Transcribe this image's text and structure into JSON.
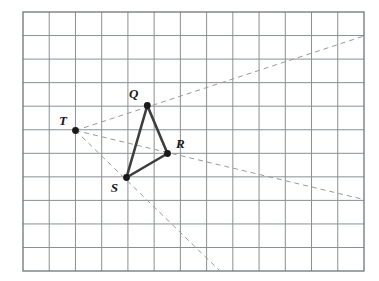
{
  "figure": {
    "name": "dilation-grid-diagram",
    "background_color": "#ffffff"
  },
  "grid": {
    "name": "graph-paper-grid",
    "columns": 13,
    "rows": 11,
    "left": 23,
    "top": 12,
    "right": 364,
    "bottom": 271,
    "cell_width": 26.23,
    "cell_height": 23.55,
    "line_color": "#8a8f96",
    "border_color": "#6f747b",
    "line_width": 1
  },
  "style": {
    "triangle_stroke": "#3d3d3d",
    "triangle_width": 2.6,
    "dashed_stroke": "#9a9a9a",
    "dashed_width": 1,
    "dash_pattern": "5,4",
    "point_fill": "#1a1a1a",
    "point_radius": 3.4,
    "label_color": "#161616"
  },
  "points": [
    {
      "id": "Q",
      "label": "Q",
      "x": 147.3,
      "y": 105.5,
      "label_x": 138.5,
      "label_y": 98,
      "label_anchor": "end"
    },
    {
      "id": "R",
      "label": "R",
      "x": 167.5,
      "y": 153.5,
      "label_x": 176,
      "label_y": 148,
      "label_anchor": "start"
    },
    {
      "id": "S",
      "label": "S",
      "x": 126.5,
      "y": 177.5,
      "label_x": 118,
      "label_y": 192,
      "label_anchor": "end"
    },
    {
      "id": "T",
      "label": "T",
      "x": 75.5,
      "y": 130.5,
      "label_x": 67,
      "label_y": 125,
      "label_anchor": "end"
    }
  ],
  "triangle": {
    "name": "triangle-QRS",
    "vertices": [
      "Q",
      "R",
      "S"
    ],
    "path": "147.3,105.5 167.5,153.5 126.5,177.5"
  },
  "rays": [
    {
      "id": "ray-T-Q",
      "from": "T",
      "through": "Q",
      "x1": 75.5,
      "y1": 130.5,
      "x2": 364,
      "y2": 36
    },
    {
      "id": "ray-T-R",
      "from": "T",
      "through": "R",
      "x1": 75.5,
      "y1": 130.5,
      "x2": 364,
      "y2": 199.5
    },
    {
      "id": "ray-T-S",
      "from": "T",
      "through": "S",
      "x1": 75.5,
      "y1": 130.5,
      "x2": 220,
      "y2": 271
    }
  ],
  "chart_data": {
    "type": "scatter",
    "title": "",
    "xlabel": "",
    "ylabel": "",
    "grid": true,
    "legend": null,
    "annotations": [
      "Q",
      "R",
      "S",
      "T"
    ],
    "points": [
      {
        "label": "Q",
        "px": 147.3,
        "py": 105.5
      },
      {
        "label": "R",
        "px": 167.5,
        "py": 153.5
      },
      {
        "label": "S",
        "px": 126.5,
        "py": 177.5
      },
      {
        "label": "T",
        "px": 75.5,
        "py": 130.5
      }
    ]
  }
}
